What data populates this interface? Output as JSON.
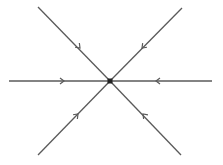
{
  "diagram": {
    "type": "phase-portrait",
    "description": "Stable star node (sink): six trajectories converging radially to an equilibrium point",
    "colors": {
      "line": "#5a5a5a",
      "node": "#222222",
      "background": "#ffffff"
    },
    "equilibrium": {
      "x": 110,
      "y": 81,
      "size": 5
    },
    "trajectories": [
      {
        "name": "upper-left",
        "from": [
          38,
          7
        ],
        "arrow": [
          80,
          48
        ],
        "direction": "inward"
      },
      {
        "name": "upper-right",
        "from": [
          182,
          8
        ],
        "arrow": [
          142,
          48
        ],
        "direction": "inward"
      },
      {
        "name": "left",
        "from": [
          9,
          81
        ],
        "arrow": [
          64,
          81
        ],
        "direction": "inward"
      },
      {
        "name": "right",
        "from": [
          212,
          81
        ],
        "arrow": [
          156,
          81
        ],
        "direction": "inward"
      },
      {
        "name": "lower-left",
        "from": [
          38,
          155
        ],
        "arrow": [
          78,
          114
        ],
        "direction": "inward"
      },
      {
        "name": "lower-right",
        "from": [
          181,
          155
        ],
        "arrow": [
          143,
          114
        ],
        "direction": "inward"
      }
    ]
  }
}
